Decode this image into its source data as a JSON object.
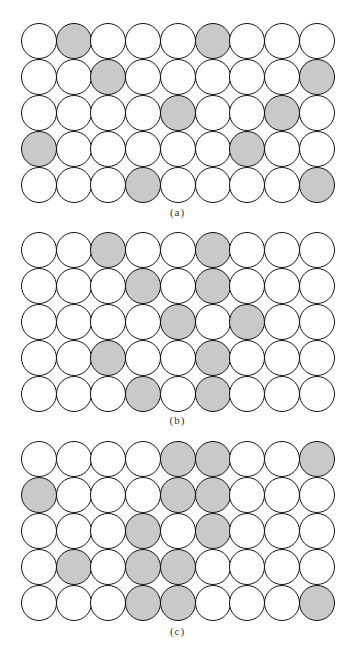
{
  "figure": {
    "grid": {
      "rows": 5,
      "cols": 9
    },
    "colors": {
      "shaded": "#c9c9c9",
      "empty": "#ffffff",
      "outline": "#111111"
    },
    "panels": [
      {
        "id": "a",
        "caption": "(a)",
        "top": 23,
        "caption_top": 206,
        "shaded_cells": [
          [
            0,
            1
          ],
          [
            0,
            5
          ],
          [
            1,
            2
          ],
          [
            1,
            8
          ],
          [
            2,
            4
          ],
          [
            2,
            7
          ],
          [
            3,
            0
          ],
          [
            3,
            6
          ],
          [
            4,
            3
          ],
          [
            4,
            8
          ]
        ]
      },
      {
        "id": "b",
        "caption": "(b)",
        "top": 232,
        "caption_top": 414,
        "shaded_cells": [
          [
            0,
            2
          ],
          [
            0,
            5
          ],
          [
            1,
            3
          ],
          [
            1,
            5
          ],
          [
            2,
            4
          ],
          [
            2,
            6
          ],
          [
            3,
            2
          ],
          [
            3,
            5
          ],
          [
            4,
            3
          ],
          [
            4,
            5
          ]
        ]
      },
      {
        "id": "c",
        "caption": "(c)",
        "top": 441,
        "caption_top": 625,
        "shaded_cells": [
          [
            0,
            4
          ],
          [
            0,
            5
          ],
          [
            0,
            8
          ],
          [
            1,
            0
          ],
          [
            1,
            4
          ],
          [
            1,
            5
          ],
          [
            2,
            3
          ],
          [
            2,
            5
          ],
          [
            3,
            1
          ],
          [
            3,
            3
          ],
          [
            3,
            4
          ],
          [
            4,
            3
          ],
          [
            4,
            4
          ],
          [
            4,
            8
          ]
        ]
      }
    ]
  }
}
